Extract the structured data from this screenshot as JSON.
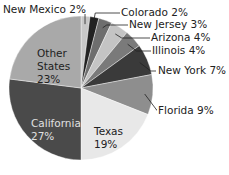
{
  "chart_data": {
    "type": "pie",
    "title": "",
    "categories": [
      "New Mexico",
      "Colorado",
      "New Jersey",
      "Arizona",
      "Illinois",
      "New York",
      "Florida",
      "Texas",
      "California",
      "Other States"
    ],
    "values": [
      2,
      2,
      3,
      4,
      4,
      7,
      9,
      19,
      27,
      23
    ],
    "unit": "%",
    "colors": [
      "#c8c8c8",
      "#222222",
      "#6e6e6e",
      "#c4c4c4",
      "#7a7a7a",
      "#3a3a3a",
      "#8e8e8e",
      "#e8e8e8",
      "#4a4a4a",
      "#a9a9a9"
    ],
    "start_angle": "12 o'clock",
    "direction": "clockwise",
    "labels": {
      "new_mexico": "New Mexico 2%",
      "colorado": "Colorado 2%",
      "new_jersey": "New Jersey 3%",
      "arizona": "Arizona 4%",
      "illinois": "Illinois 4%",
      "new_york": "New York 7%",
      "florida": "Florida 9%",
      "texas_name": "Texas",
      "texas_pct": "19%",
      "california_name": "California",
      "california_pct": "27%",
      "other_name_1": "Other",
      "other_name_2": "States",
      "other_pct": "23%"
    }
  }
}
